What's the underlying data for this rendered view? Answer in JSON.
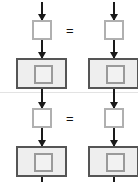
{
  "diagram": {
    "title": "",
    "type": "flow-equation-diagram",
    "canvas": {
      "width": 138,
      "height": 182,
      "background": "#ffffff"
    },
    "colors": {
      "arrow": "#1a1a1a",
      "small_square_border": "#b0b0b0",
      "small_square_fill": "#ffffff",
      "big_rect_border": "#555555",
      "big_rect_fill": "#eeeeee",
      "inner_square_border": "#9a9a9a",
      "inner_square_fill": "#f2f2f2",
      "equals_text": "#111111",
      "separator": "#e3e3e3"
    },
    "operators": [
      {
        "id": "equals-top",
        "symbol": "="
      },
      {
        "id": "equals-bottom",
        "symbol": "="
      }
    ],
    "rows": [
      {
        "id": "row-top",
        "columns": [
          {
            "id": "row-top-left",
            "nodes": [
              {
                "id": "arrow-in",
                "kind": "arrow",
                "label": ""
              },
              {
                "id": "small-square",
                "kind": "square",
                "label": ""
              },
              {
                "id": "arrow-mid",
                "kind": "arrow",
                "label": ""
              },
              {
                "id": "big-rect",
                "kind": "rectangle",
                "label": "",
                "child": {
                  "id": "inner-square",
                  "kind": "square",
                  "label": ""
                }
              }
            ]
          },
          {
            "id": "row-top-right",
            "nodes": [
              {
                "id": "arrow-in",
                "kind": "arrow",
                "label": ""
              },
              {
                "id": "small-square",
                "kind": "square",
                "label": ""
              },
              {
                "id": "arrow-mid",
                "kind": "arrow",
                "label": ""
              },
              {
                "id": "big-rect",
                "kind": "rectangle",
                "label": "",
                "child": {
                  "id": "inner-square",
                  "kind": "square",
                  "label": ""
                }
              }
            ]
          }
        ]
      },
      {
        "id": "row-bottom",
        "columns": [
          {
            "id": "row-bottom-left",
            "nodes": [
              {
                "id": "arrow-in",
                "kind": "arrow",
                "label": ""
              },
              {
                "id": "small-square",
                "kind": "square",
                "label": ""
              },
              {
                "id": "arrow-mid",
                "kind": "arrow",
                "label": ""
              },
              {
                "id": "big-rect",
                "kind": "rectangle",
                "label": "",
                "child": {
                  "id": "inner-square",
                  "kind": "square",
                  "label": ""
                }
              }
            ]
          },
          {
            "id": "row-bottom-right",
            "nodes": [
              {
                "id": "arrow-in",
                "kind": "arrow",
                "label": ""
              },
              {
                "id": "small-square",
                "kind": "square",
                "label": ""
              },
              {
                "id": "arrow-mid",
                "kind": "arrow",
                "label": ""
              },
              {
                "id": "big-rect",
                "kind": "rectangle",
                "label": "",
                "child": {
                  "id": "inner-square",
                  "kind": "square",
                  "label": ""
                }
              }
            ]
          }
        ]
      }
    ]
  }
}
